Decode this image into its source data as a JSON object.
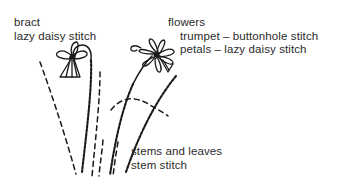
{
  "figure": {
    "background_color": "#ffffff",
    "ink_color": "#1a1a1a",
    "text_color": "#2b2b2b"
  },
  "labels": {
    "bract": {
      "line1": "bract",
      "line2": "lazy daisy stitch"
    },
    "flowers": {
      "line1": "flowers",
      "line2": "trumpet – buttonhole stitch",
      "line3": "petals – lazy daisy stitch"
    },
    "stems": {
      "line1": "stems and leaves",
      "line2": "stem stitch"
    }
  },
  "drawing": {
    "left_flower": {
      "name": "nodding flower head with trumpet",
      "center": [
        74,
        58
      ],
      "petal_count": 4,
      "has_trumpet": true
    },
    "right_flower": {
      "name": "open flower head with radiating petals",
      "center": [
        158,
        53
      ],
      "petal_count": 7,
      "has_trumpet": true
    },
    "stems": [
      {
        "name": "left-flower-stem",
        "style": "stem-stitch-textured"
      },
      {
        "name": "right-flower-stem",
        "style": "stem-stitch-textured"
      },
      {
        "name": "right-outer-stem",
        "style": "stem-stitch-textured"
      }
    ],
    "leaves": [
      {
        "name": "left-outer-leaf",
        "style": "dashed"
      },
      {
        "name": "center-leaf",
        "style": "dashed"
      },
      {
        "name": "arching-leaf",
        "style": "dashed"
      },
      {
        "name": "short-base-leaf",
        "style": "dashed"
      }
    ]
  }
}
